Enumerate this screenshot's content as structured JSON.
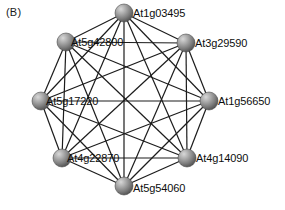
{
  "figure": {
    "panel_label": "(B)",
    "background_color": "#ffffff",
    "width": 285,
    "height": 210
  },
  "style": {
    "edge_color": "#1c1c1c",
    "edge_width": 1.2,
    "node_radius": 9,
    "node_fill_light": "#cfcfcf",
    "node_fill_mid": "#8f8f8f",
    "node_fill_dark": "#565656",
    "node_stroke": "#4a4a4a",
    "label_color": "#0d0d0d"
  },
  "chart_data": {
    "type": "network",
    "title": "",
    "layout": "circular",
    "directed": false,
    "complete_graph": true,
    "node_count": 8,
    "edge_count": 28,
    "nodes": [
      {
        "id": "At1g03495",
        "label": "At1g03495",
        "x": 124,
        "y": 13,
        "label_dx": 9,
        "label_dy": -5
      },
      {
        "id": "At3g29590",
        "label": "At3g29590",
        "x": 186,
        "y": 43,
        "label_dx": 9,
        "label_dy": -5
      },
      {
        "id": "At1g56650",
        "label": "At1g56650",
        "x": 209,
        "y": 101,
        "label_dx": 9,
        "label_dy": -5
      },
      {
        "id": "At4g14090",
        "label": "At4g14090",
        "x": 187,
        "y": 158,
        "label_dx": 9,
        "label_dy": -5
      },
      {
        "id": "At5g54060",
        "label": "At5g54060",
        "x": 124,
        "y": 186,
        "label_dx": 9,
        "label_dy": -3
      },
      {
        "id": "At4g22870",
        "label": "At4g22870",
        "x": 62,
        "y": 158,
        "label_dx": 5,
        "label_dy": -5
      },
      {
        "id": "At5g17220",
        "label": "At5g17220",
        "x": 41,
        "y": 101,
        "label_dx": 5,
        "label_dy": -5
      },
      {
        "id": "At5g42800",
        "label": "At5g42800",
        "x": 66,
        "y": 42,
        "label_dx": 5,
        "label_dy": -5
      }
    ],
    "edges": [
      [
        "At1g03495",
        "At3g29590"
      ],
      [
        "At1g03495",
        "At1g56650"
      ],
      [
        "At1g03495",
        "At4g14090"
      ],
      [
        "At1g03495",
        "At5g54060"
      ],
      [
        "At1g03495",
        "At4g22870"
      ],
      [
        "At1g03495",
        "At5g17220"
      ],
      [
        "At1g03495",
        "At5g42800"
      ],
      [
        "At3g29590",
        "At1g56650"
      ],
      [
        "At3g29590",
        "At4g14090"
      ],
      [
        "At3g29590",
        "At5g54060"
      ],
      [
        "At3g29590",
        "At4g22870"
      ],
      [
        "At3g29590",
        "At5g17220"
      ],
      [
        "At3g29590",
        "At5g42800"
      ],
      [
        "At1g56650",
        "At4g14090"
      ],
      [
        "At1g56650",
        "At5g54060"
      ],
      [
        "At1g56650",
        "At4g22870"
      ],
      [
        "At1g56650",
        "At5g17220"
      ],
      [
        "At1g56650",
        "At5g42800"
      ],
      [
        "At4g14090",
        "At5g54060"
      ],
      [
        "At4g14090",
        "At4g22870"
      ],
      [
        "At4g14090",
        "At5g17220"
      ],
      [
        "At4g14090",
        "At5g42800"
      ],
      [
        "At5g54060",
        "At4g22870"
      ],
      [
        "At5g54060",
        "At5g17220"
      ],
      [
        "At5g54060",
        "At5g42800"
      ],
      [
        "At4g22870",
        "At5g17220"
      ],
      [
        "At4g22870",
        "At5g42800"
      ],
      [
        "At5g17220",
        "At5g42800"
      ]
    ]
  }
}
